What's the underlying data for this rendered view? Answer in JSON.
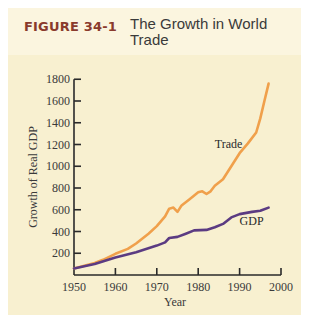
{
  "figure": {
    "number": "FIGURE 34-1",
    "title": "The Growth in World Trade"
  },
  "colors": {
    "trade": "#f0a04b",
    "gdp": "#5b3b82",
    "axis": "#2a2a2a",
    "figure_number": "#8a3a2c",
    "panel": "#f8f0d0",
    "header": "#fbf5df"
  },
  "chart_data": {
    "type": "line",
    "title": "The Growth in World Trade",
    "xlabel": "Year",
    "ylabel": "Growth of Real GDP",
    "xlim": [
      1950,
      2000
    ],
    "ylim": [
      0,
      1800
    ],
    "x_ticks": [
      1950,
      1960,
      1970,
      1980,
      1990,
      2000
    ],
    "y_ticks": [
      200,
      400,
      600,
      800,
      1000,
      1200,
      1400,
      1600,
      1800
    ],
    "grid": false,
    "legend": "inline labels",
    "series": [
      {
        "name": "Trade",
        "x": [
          1950,
          1955,
          1957,
          1960,
          1963,
          1965,
          1968,
          1970,
          1972,
          1973,
          1974,
          1975,
          1976,
          1978,
          1980,
          1981,
          1982,
          1983,
          1984,
          1986,
          1988,
          1990,
          1992,
          1994,
          1995,
          1996,
          1997
        ],
        "values": [
          60,
          110,
          140,
          195,
          240,
          290,
          380,
          450,
          540,
          610,
          620,
          580,
          640,
          700,
          760,
          770,
          745,
          770,
          820,
          880,
          1000,
          1120,
          1210,
          1310,
          1440,
          1600,
          1760
        ]
      },
      {
        "name": "GDP",
        "x": [
          1950,
          1955,
          1960,
          1965,
          1970,
          1972,
          1973,
          1975,
          1977,
          1979,
          1982,
          1984,
          1986,
          1988,
          1990,
          1993,
          1995,
          1997
        ],
        "values": [
          60,
          100,
          160,
          210,
          270,
          300,
          340,
          350,
          380,
          410,
          415,
          440,
          470,
          530,
          560,
          580,
          590,
          620
        ]
      }
    ],
    "annotations": [
      {
        "text": "Trade",
        "x": 1984,
        "y": 1170
      },
      {
        "text": "GDP",
        "x": 1990,
        "y": 460
      }
    ]
  }
}
